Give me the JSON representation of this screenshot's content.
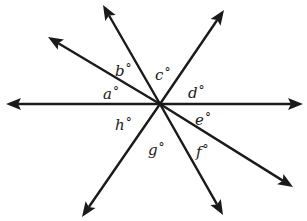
{
  "diagram": {
    "type": "intersecting-rays",
    "center": {
      "x": 160,
      "y": 104
    },
    "line_color": "#1a1a1a",
    "background": "#ffffff",
    "rays": [
      {
        "name": "left",
        "tip": {
          "x": 6,
          "y": 104
        }
      },
      {
        "name": "upper-left-shallow",
        "tip": {
          "x": 48,
          "y": 37
        }
      },
      {
        "name": "upper-left-steep",
        "tip": {
          "x": 103,
          "y": 5
        }
      },
      {
        "name": "upper-right",
        "tip": {
          "x": 224,
          "y": 10
        }
      },
      {
        "name": "right",
        "tip": {
          "x": 303,
          "y": 104
        }
      },
      {
        "name": "lower-right-shallow",
        "tip": {
          "x": 293,
          "y": 187
        }
      },
      {
        "name": "lower-right-steep",
        "tip": {
          "x": 223,
          "y": 215
        }
      },
      {
        "name": "lower-left",
        "tip": {
          "x": 82,
          "y": 217
        }
      }
    ],
    "angles": [
      {
        "letter": "a",
        "degree": "°",
        "pos": {
          "x": 103,
          "y": 85
        }
      },
      {
        "letter": "b",
        "degree": "°",
        "pos": {
          "x": 115,
          "y": 62
        }
      },
      {
        "letter": "c",
        "degree": "°",
        "pos": {
          "x": 155,
          "y": 66
        }
      },
      {
        "letter": "d",
        "degree": "°",
        "pos": {
          "x": 188,
          "y": 84
        }
      },
      {
        "letter": "e",
        "degree": "°",
        "pos": {
          "x": 195,
          "y": 111
        }
      },
      {
        "letter": "f",
        "degree": "°",
        "pos": {
          "x": 196,
          "y": 143
        }
      },
      {
        "letter": "g",
        "degree": "°",
        "pos": {
          "x": 148,
          "y": 141
        }
      },
      {
        "letter": "h",
        "degree": "°",
        "pos": {
          "x": 115,
          "y": 116
        }
      }
    ]
  }
}
